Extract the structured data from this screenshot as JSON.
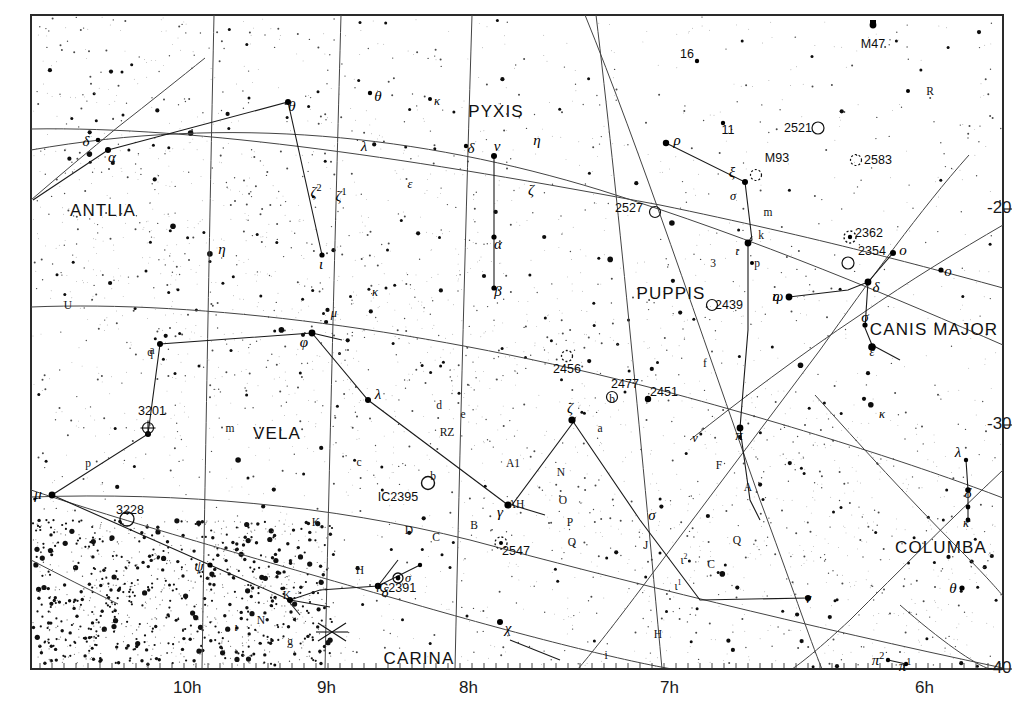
{
  "chart_data": {
    "type": "scatter",
    "title": "",
    "subtitle": "",
    "xlabel": "Right Ascension",
    "ylabel": "Declination",
    "xlim": [
      10.5,
      5.75
    ],
    "ylim": [
      -40,
      -14
    ],
    "grid": true,
    "legend": "none",
    "x_tick_labels": [
      "10h",
      "9h",
      "8h",
      "7h",
      "6h"
    ],
    "x_tick_values": [
      10,
      9,
      8,
      7,
      6
    ],
    "y_tick_labels": [
      "-20",
      "-30",
      "-40"
    ],
    "y_tick_values": [
      -20,
      -30,
      -40
    ],
    "constellations": [
      {
        "name": "ANTLIA",
        "x": 103,
        "y": 211
      },
      {
        "name": "PYXIS",
        "x": 496,
        "y": 112
      },
      {
        "name": "PUPPIS",
        "x": 671,
        "y": 294
      },
      {
        "name": "CANIS MAJOR",
        "x": 934,
        "y": 330
      },
      {
        "name": "VELA",
        "x": 277,
        "y": 434
      },
      {
        "name": "COLUMBA",
        "x": 941,
        "y": 548
      },
      {
        "name": "CARINA",
        "x": 419,
        "y": 659
      }
    ],
    "deep_sky_objects": [
      {
        "label": "M47",
        "x": 873,
        "y": 44,
        "marker": "cluster-fill"
      },
      {
        "label": "2521",
        "x": 798,
        "y": 128,
        "marker": "open-cluster"
      },
      {
        "label": "2583",
        "x": 878,
        "y": 160,
        "marker": "open-cluster-dotted"
      },
      {
        "label": "M93",
        "x": 777,
        "y": 158,
        "marker": "open-cluster-dotted"
      },
      {
        "label": "2527",
        "x": 629,
        "y": 208,
        "marker": "open-cluster"
      },
      {
        "label": "2362",
        "x": 869,
        "y": 233,
        "marker": "open-cluster-dotted"
      },
      {
        "label": "2354",
        "x": 872,
        "y": 251,
        "marker": "open-cluster"
      },
      {
        "label": "2439",
        "x": 729,
        "y": 305,
        "marker": "open-cluster"
      },
      {
        "label": "2456",
        "x": 567,
        "y": 369,
        "marker": "open-cluster-dotted"
      },
      {
        "label": "2477",
        "x": 625,
        "y": 384,
        "marker": "open-cluster"
      },
      {
        "label": "2451",
        "x": 664,
        "y": 392,
        "marker": "cluster-stars"
      },
      {
        "label": "3201",
        "x": 152,
        "y": 411,
        "marker": "globular"
      },
      {
        "label": "3228",
        "x": 130,
        "y": 510,
        "marker": "open-cluster"
      },
      {
        "label": "IC2391",
        "x": 396,
        "y": 588,
        "marker": "open-cluster-bright"
      },
      {
        "label": "IC2395",
        "x": 398,
        "y": 497,
        "marker": "open-cluster"
      },
      {
        "label": "2547",
        "x": 516,
        "y": 551,
        "marker": "open-cluster-dotted"
      }
    ],
    "star_labels": [
      {
        "t": "δ",
        "x": 86,
        "y": 141,
        "k": "g"
      },
      {
        "t": "α",
        "x": 112,
        "y": 157,
        "k": "g"
      },
      {
        "t": "θ",
        "x": 292,
        "y": 106,
        "k": "g"
      },
      {
        "t": "θ",
        "x": 378,
        "y": 96,
        "k": "g"
      },
      {
        "t": "κ",
        "x": 437,
        "y": 101,
        "k": "gs"
      },
      {
        "t": "η",
        "x": 537,
        "y": 140,
        "k": "g"
      },
      {
        "t": "δ",
        "x": 471,
        "y": 148,
        "k": "g"
      },
      {
        "t": "ν",
        "x": 497,
        "y": 146,
        "k": "g"
      },
      {
        "t": "λ",
        "x": 364,
        "y": 146,
        "k": "g"
      },
      {
        "t": "ζ",
        "x": 531,
        "y": 190,
        "k": "g"
      },
      {
        "t": "ε",
        "x": 410,
        "y": 184,
        "k": "gs"
      },
      {
        "t": "ζ²",
        "x": 316,
        "y": 191,
        "k": "g2"
      },
      {
        "t": "ζ¹",
        "x": 341,
        "y": 195,
        "k": "g2"
      },
      {
        "t": "α",
        "x": 498,
        "y": 244,
        "k": "g"
      },
      {
        "t": "β",
        "x": 498,
        "y": 291,
        "k": "g"
      },
      {
        "t": "ι",
        "x": 321,
        "y": 264,
        "k": "g"
      },
      {
        "t": "η",
        "x": 222,
        "y": 249,
        "k": "g"
      },
      {
        "t": "U",
        "x": 68,
        "y": 305,
        "k": "l"
      },
      {
        "t": "κ",
        "x": 375,
        "y": 292,
        "k": "gs"
      },
      {
        "t": "μ",
        "x": 334,
        "y": 313,
        "k": "gs"
      },
      {
        "t": "ι",
        "x": 236,
        "y": 627,
        "k": "gs"
      },
      {
        "t": "16",
        "x": 687,
        "y": 54,
        "k": "d"
      },
      {
        "t": "11",
        "x": 728,
        "y": 130,
        "k": "d"
      },
      {
        "t": "ρ",
        "x": 677,
        "y": 140,
        "k": "g"
      },
      {
        "t": "ξ",
        "x": 732,
        "y": 172,
        "k": "g"
      },
      {
        "t": "σ",
        "x": 733,
        "y": 196,
        "k": "gs"
      },
      {
        "t": "m",
        "x": 768,
        "y": 212,
        "k": "l"
      },
      {
        "t": "k",
        "x": 761,
        "y": 235,
        "k": "l"
      },
      {
        "t": "3",
        "x": 713,
        "y": 263,
        "k": "l"
      },
      {
        "t": "ι",
        "x": 737,
        "y": 251,
        "k": "gs"
      },
      {
        "t": "p",
        "x": 757,
        "y": 263,
        "k": "l"
      },
      {
        "t": "R",
        "x": 930,
        "y": 91,
        "k": "l"
      },
      {
        "t": "o",
        "x": 903,
        "y": 250,
        "k": "g"
      },
      {
        "t": "o",
        "x": 948,
        "y": 271,
        "k": "g"
      },
      {
        "t": "ω",
        "x": 778,
        "y": 296,
        "k": "g"
      },
      {
        "t": "η",
        "x": 776,
        "y": 296,
        "k": "g"
      },
      {
        "t": "δ",
        "x": 876,
        "y": 287,
        "k": "g"
      },
      {
        "t": "σ",
        "x": 865,
        "y": 317,
        "k": "g"
      },
      {
        "t": "ε",
        "x": 872,
        "y": 352,
        "k": "gs"
      },
      {
        "t": "q",
        "x": 150,
        "y": 352,
        "k": "l"
      },
      {
        "t": "φ",
        "x": 304,
        "y": 342,
        "k": "g"
      },
      {
        "t": "m",
        "x": 230,
        "y": 428,
        "k": "l"
      },
      {
        "t": "p",
        "x": 88,
        "y": 463,
        "k": "l"
      },
      {
        "t": "μ",
        "x": 38,
        "y": 494,
        "k": "g"
      },
      {
        "t": "λ",
        "x": 378,
        "y": 394,
        "k": "g"
      },
      {
        "t": "d",
        "x": 439,
        "y": 405,
        "k": "l"
      },
      {
        "t": "e",
        "x": 463,
        "y": 414,
        "k": "l"
      },
      {
        "t": "RZ",
        "x": 447,
        "y": 432,
        "k": "l"
      },
      {
        "t": "c",
        "x": 359,
        "y": 462,
        "k": "l"
      },
      {
        "t": "b",
        "x": 433,
        "y": 476,
        "k": "l"
      },
      {
        "t": "A1",
        "x": 513,
        "y": 463,
        "k": "l"
      },
      {
        "t": "AH",
        "x": 516,
        "y": 504,
        "k": "l"
      },
      {
        "t": "γ",
        "x": 500,
        "y": 512,
        "k": "g"
      },
      {
        "t": "B",
        "x": 474,
        "y": 525,
        "k": "l"
      },
      {
        "t": "D",
        "x": 409,
        "y": 530,
        "k": "l"
      },
      {
        "t": "C",
        "x": 436,
        "y": 537,
        "k": "l"
      },
      {
        "t": "H",
        "x": 360,
        "y": 570,
        "k": "l"
      },
      {
        "t": "σ",
        "x": 408,
        "y": 578,
        "k": "gs"
      },
      {
        "t": "ζ",
        "x": 570,
        "y": 408,
        "k": "g"
      },
      {
        "t": "N",
        "x": 561,
        "y": 472,
        "k": "l"
      },
      {
        "t": "O",
        "x": 563,
        "y": 500,
        "k": "l"
      },
      {
        "t": "P",
        "x": 570,
        "y": 522,
        "k": "l"
      },
      {
        "t": "Q",
        "x": 572,
        "y": 542,
        "k": "l"
      },
      {
        "t": "b",
        "x": 612,
        "y": 399,
        "k": "l"
      },
      {
        "t": "a",
        "x": 600,
        "y": 428,
        "k": "l"
      },
      {
        "t": "f",
        "x": 705,
        "y": 363,
        "k": "l"
      },
      {
        "t": "v",
        "x": 695,
        "y": 438,
        "k": "gs"
      },
      {
        "t": "π",
        "x": 739,
        "y": 435,
        "k": "g"
      },
      {
        "t": "F",
        "x": 719,
        "y": 465,
        "k": "l"
      },
      {
        "t": "A",
        "x": 748,
        "y": 487,
        "k": "l"
      },
      {
        "t": "σ",
        "x": 652,
        "y": 515,
        "k": "g"
      },
      {
        "t": "J",
        "x": 646,
        "y": 545,
        "k": "l"
      },
      {
        "t": "ι²",
        "x": 684,
        "y": 559,
        "k": "l2"
      },
      {
        "t": "C",
        "x": 711,
        "y": 564,
        "k": "l"
      },
      {
        "t": "ι¹",
        "x": 678,
        "y": 585,
        "k": "l2"
      },
      {
        "t": "Q",
        "x": 737,
        "y": 540,
        "k": "l"
      },
      {
        "t": "ν",
        "x": 808,
        "y": 598,
        "k": "g"
      },
      {
        "t": "H",
        "x": 658,
        "y": 634,
        "k": "l"
      },
      {
        "t": "i",
        "x": 606,
        "y": 655,
        "k": "l"
      },
      {
        "t": "κ",
        "x": 882,
        "y": 414,
        "k": "gs"
      },
      {
        "t": "λ",
        "x": 958,
        "y": 452,
        "k": "g"
      },
      {
        "t": "δ",
        "x": 968,
        "y": 493,
        "k": "g"
      },
      {
        "t": "κ",
        "x": 966,
        "y": 523,
        "k": "gs"
      },
      {
        "t": "θ",
        "x": 953,
        "y": 588,
        "k": "g"
      },
      {
        "t": "π²",
        "x": 878,
        "y": 659,
        "k": "g2"
      },
      {
        "t": "π¹",
        "x": 905,
        "y": 665,
        "k": "g2"
      },
      {
        "t": "K",
        "x": 316,
        "y": 522,
        "k": "l"
      },
      {
        "t": "K",
        "x": 287,
        "y": 595,
        "k": "l"
      },
      {
        "t": "ψ",
        "x": 199,
        "y": 566,
        "k": "g"
      },
      {
        "t": "N",
        "x": 261,
        "y": 620,
        "k": "l"
      },
      {
        "t": "g",
        "x": 290,
        "y": 641,
        "k": "l"
      },
      {
        "t": "δ",
        "x": 385,
        "y": 592,
        "k": "g"
      },
      {
        "t": "χ",
        "x": 508,
        "y": 628,
        "k": "g"
      },
      {
        "t": "a",
        "x": 152,
        "y": 350,
        "k": "l"
      }
    ]
  }
}
